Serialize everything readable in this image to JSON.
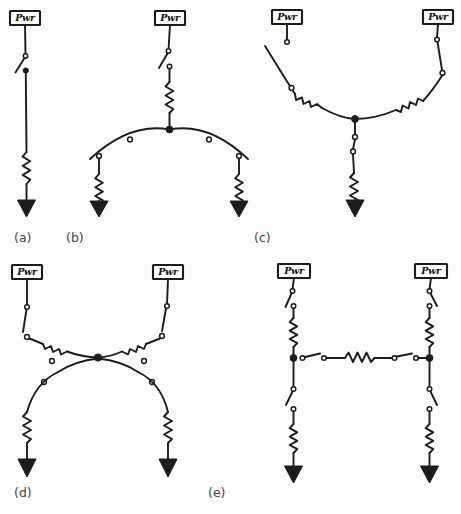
{
  "figure": {
    "name": "power-distribution-topologies",
    "background_color": "#fdfdfd",
    "line_color": "#1c1c1c",
    "label_color": "#444444",
    "width": 461,
    "height": 514
  },
  "symbols": {
    "source_label": "Pwr",
    "source_label_full": "Power source block labeled Pwr",
    "switch_name": "open-switch",
    "resistor_name": "resistor-zigzag",
    "load_name": "load-arrowhead",
    "node_name": "junction-node"
  },
  "panels": [
    {
      "id": "a",
      "label": "(a)",
      "label_x": 14,
      "label_y": 242,
      "description": "Single radial feeder: one Pwr source, one switch, one resistor, one load",
      "sources": 1,
      "switches": 1,
      "resistors": 1,
      "loads": 1,
      "nodes": 0
    },
    {
      "id": "b",
      "label": "(b)",
      "label_x": 66,
      "label_y": 242,
      "description": "One Pwr source feeding an arched bus that splits to two loads",
      "sources": 1,
      "switches": 3,
      "resistors": 3,
      "loads": 2,
      "nodes": 1
    },
    {
      "id": "c",
      "label": "(c)",
      "label_x": 254,
      "label_y": 242,
      "description": "Two Pwr sources joining a dipped bus feeding one common load",
      "sources": 2,
      "switches": 3,
      "resistors": 3,
      "loads": 1,
      "nodes": 1
    },
    {
      "id": "d",
      "label": "(d)",
      "label_x": 14,
      "label_y": 497,
      "description": "Hourglass topology: two Pwr sources converge at a node then diverge to two loads",
      "sources": 2,
      "switches": 4,
      "resistors": 4,
      "loads": 2,
      "nodes": 1
    },
    {
      "id": "e",
      "label": "(e)",
      "label_x": 208,
      "label_y": 497,
      "description": "Two vertical feeders linked by a horizontal tie line with switches and a resistor",
      "sources": 2,
      "switches": 6,
      "resistors": 5,
      "loads": 2,
      "nodes": 2
    }
  ],
  "source_blocks": [
    {
      "panel": "a",
      "x": 10,
      "y": 11,
      "w": 30,
      "h": 14,
      "text": "Pwr"
    },
    {
      "panel": "b",
      "x": 155,
      "y": 11,
      "w": 30,
      "h": 14,
      "text": "Pwr"
    },
    {
      "panel": "c",
      "panel_side": "left",
      "x": 272,
      "y": 10,
      "w": 30,
      "h": 14,
      "text": "Pwr"
    },
    {
      "panel": "c",
      "panel_side": "right",
      "x": 423,
      "y": 10,
      "w": 30,
      "h": 14,
      "text": "Pwr"
    },
    {
      "panel": "d",
      "panel_side": "left",
      "x": 12,
      "y": 265,
      "w": 30,
      "h": 14,
      "text": "Pwr"
    },
    {
      "panel": "d",
      "panel_side": "right",
      "x": 153,
      "y": 265,
      "w": 30,
      "h": 14,
      "text": "Pwr"
    },
    {
      "panel": "e",
      "panel_side": "left",
      "x": 278,
      "y": 264,
      "w": 32,
      "h": 14,
      "text": "Pwr"
    },
    {
      "panel": "e",
      "panel_side": "right",
      "x": 415,
      "y": 264,
      "w": 32,
      "h": 14,
      "text": "Pwr"
    }
  ]
}
